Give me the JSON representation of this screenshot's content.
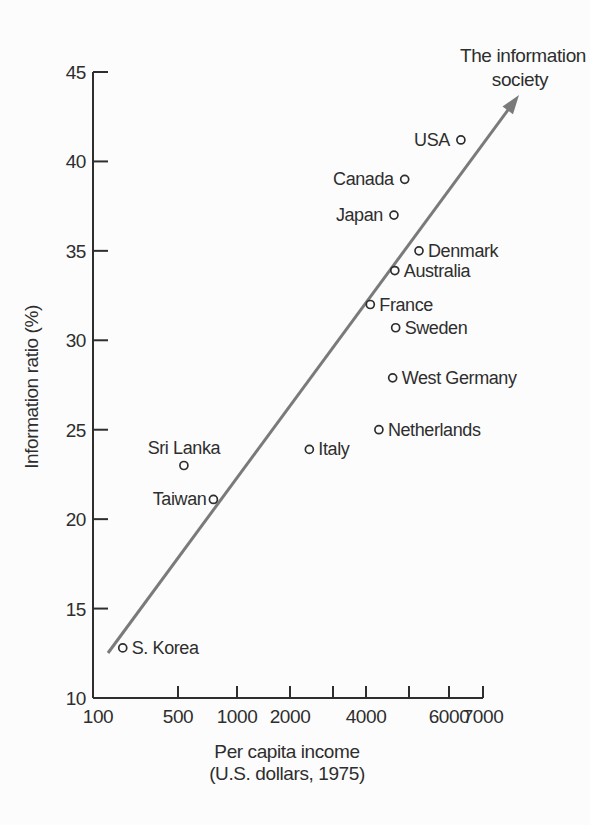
{
  "figure_caption": {
    "xlabel_line1": "Per capita income",
    "xlabel_line2": "(U.S. dollars, 1975)",
    "ylabel": "Information ratio (%)"
  },
  "chart_data": {
    "type": "scatter",
    "title": "",
    "annotation": {
      "text_lines": [
        "The information",
        "society"
      ]
    },
    "xlabel": "Per capita income (U.S. dollars, 1975)",
    "ylabel": "Information ratio (%)",
    "x_scale": "stylized-log",
    "xlim": [
      100,
      7000
    ],
    "ylim": [
      10,
      45
    ],
    "grid": false,
    "legend": "none",
    "x_ticks": [
      {
        "value": 100,
        "label": "100",
        "mark": false
      },
      {
        "value": 500,
        "label": "500",
        "mark": true
      },
      {
        "value": 1000,
        "label": "1000",
        "mark": true
      },
      {
        "value": 2000,
        "label": "2000",
        "mark": true
      },
      {
        "value": 3000,
        "label": "",
        "mark": true
      },
      {
        "value": 4000,
        "label": "4000",
        "mark": true
      },
      {
        "value": 5000,
        "label": "",
        "mark": true
      },
      {
        "value": 6000,
        "label": "6000",
        "mark": true
      },
      {
        "value": 7000,
        "label": "7000",
        "mark": true
      }
    ],
    "y_ticks": [
      {
        "value": 45,
        "label": "45",
        "mark": true
      },
      {
        "value": 40,
        "label": "40",
        "mark": true
      },
      {
        "value": 35,
        "label": "35",
        "mark": true
      },
      {
        "value": 30,
        "label": "30",
        "mark": true
      },
      {
        "value": 25,
        "label": "25",
        "mark": true
      },
      {
        "value": 20,
        "label": "20",
        "mark": true
      },
      {
        "value": 15,
        "label": "15",
        "mark": true
      },
      {
        "value": 10,
        "label": "10",
        "mark": false
      }
    ],
    "points": [
      {
        "country": "USA",
        "income": 6350,
        "ratio": 41.2,
        "label_side": "left"
      },
      {
        "country": "Canada",
        "income": 4900,
        "ratio": 39.0,
        "label_side": "left"
      },
      {
        "country": "Japan",
        "income": 4650,
        "ratio": 37.0,
        "label_side": "left"
      },
      {
        "country": "Denmark",
        "income": 5250,
        "ratio": 35.0,
        "label_side": "right"
      },
      {
        "country": "Australia",
        "income": 4670,
        "ratio": 33.9,
        "label_side": "right"
      },
      {
        "country": "France",
        "income": 4100,
        "ratio": 32.0,
        "label_side": "right"
      },
      {
        "country": "Sweden",
        "income": 4690,
        "ratio": 30.7,
        "label_side": "right"
      },
      {
        "country": "West Germany",
        "income": 4620,
        "ratio": 27.9,
        "label_side": "right"
      },
      {
        "country": "Netherlands",
        "income": 4300,
        "ratio": 25.0,
        "label_side": "right"
      },
      {
        "country": "Italy",
        "income": 2450,
        "ratio": 23.9,
        "label_side": "right"
      },
      {
        "country": "Sri Lanka",
        "income": 550,
        "ratio": 23.0,
        "label_side": "above"
      },
      {
        "country": "Taiwan",
        "income": 800,
        "ratio": 21.1,
        "label_side": "left",
        "label_gap": 3
      },
      {
        "country": "S. Korea",
        "income": 240,
        "ratio": 12.8,
        "label_side": "right"
      }
    ],
    "colors": {
      "ink": "#2e2e2e",
      "arrow": "#7a7a7a",
      "background": "#fcfcfc",
      "point_fill": "#fcfcfc"
    },
    "layout": {
      "plot_box": {
        "left": 93,
        "top": 72,
        "right": 483,
        "bottom": 698
      },
      "x_tick_px": [
        93,
        178,
        237,
        290,
        333,
        366,
        409,
        449,
        483
      ],
      "arrow_px": {
        "x1": 108,
        "y1": 653,
        "x2": 519,
        "y2": 95
      },
      "point_radius": 4
    }
  }
}
